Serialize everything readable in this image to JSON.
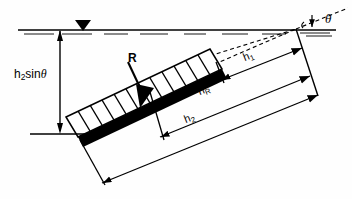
{
  "figure": {
    "background_color": "#fefefe",
    "line_color": "#000000",
    "plate_fill": "#000000",
    "surface_color": "#000000"
  },
  "labels": {
    "depth_vertical": {
      "text": "h2sinθ",
      "base": "h",
      "sub": "2",
      "tail": "sin",
      "angle": "θ",
      "x": 14,
      "y": 75
    },
    "resultant": {
      "text": "R",
      "x": 130,
      "y": 59
    },
    "h1": {
      "text": "h1",
      "base": "h",
      "sub": "1",
      "x": 243,
      "y": 58,
      "rotation": -22
    },
    "hR": {
      "text": "hR",
      "base": "h",
      "sub": "R",
      "x": 196,
      "y": 93,
      "rotation": -22
    },
    "h2": {
      "text": "h2",
      "base": "h",
      "sub": "2",
      "x": 182,
      "y": 120,
      "rotation": -22
    },
    "theta": {
      "text": "θ",
      "x": 327,
      "y": 12
    }
  },
  "elements": {
    "free_surface_line": "horizontal water surface at y=30",
    "free_surface_triangle": "filled down-pointing triangle marker at x=82",
    "water_hatch": "broken horizontal dashes along surface",
    "plate": "thick black inclined plate from (78,137) to (222,69)",
    "pressure_block": "hatched rectangle of 12 vertical division lines above plate",
    "resultant_arrow": "thick downward arrow from R label into plate",
    "dashed_apex_lines": "two dashed construction lines converging at apex (296,29)",
    "dimension_h1": "arrow from plate top-end to apex witness line",
    "dimension_hR": "arrow from resultant point to apex witness line",
    "dimension_h2": "arrow from plate bottom-end to apex witness line",
    "vertical_depth_dimension": "double headed vertical arrow at x=60 between y=29 and y=133",
    "bottom_reference_line": "horizontal line at y=133 from x=30 to x=88",
    "angle_tick": "small vertical arrow marking theta at x=312"
  },
  "icons": {
    "free_surface_marker": "water-surface-triangle",
    "resultant_force": "down-arrow"
  }
}
